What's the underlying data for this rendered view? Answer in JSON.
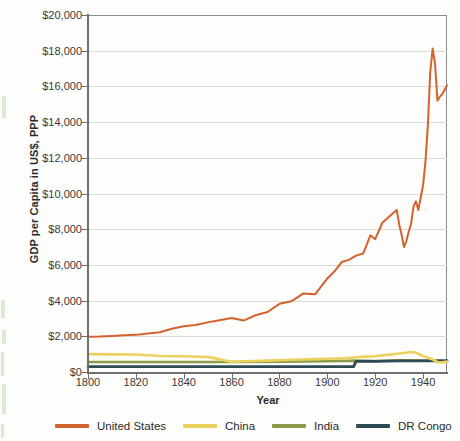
{
  "chart_data": {
    "type": "line",
    "title": "",
    "xlabel": "Year",
    "ylabel": "GDP per Capita in US$, PPP",
    "xlim": [
      1800,
      1950
    ],
    "ylim": [
      0,
      20000
    ],
    "grid": true,
    "legend_position": "bottom",
    "xticks": [
      1800,
      1820,
      1840,
      1860,
      1880,
      1900,
      1920,
      1940
    ],
    "xtick_labels": [
      "1800",
      "1820",
      "1840",
      "1860",
      "1880",
      "1900",
      "1920",
      "1940"
    ],
    "yticks": [
      0,
      2000,
      4000,
      6000,
      8000,
      10000,
      12000,
      14000,
      16000,
      18000,
      20000
    ],
    "ytick_labels": [
      "$0",
      "$2,000",
      "$4,000",
      "$6,000",
      "$8,000",
      "$10,000",
      "$12,000",
      "$14,000",
      "$16,000",
      "$18,000",
      "$20,000"
    ],
    "series": [
      {
        "name": "United States",
        "color": "#D2622E",
        "x": [
          1800,
          1805,
          1810,
          1815,
          1820,
          1825,
          1830,
          1835,
          1840,
          1845,
          1850,
          1855,
          1860,
          1865,
          1870,
          1875,
          1880,
          1885,
          1890,
          1895,
          1900,
          1903,
          1906,
          1909,
          1912,
          1915,
          1918,
          1920,
          1923,
          1926,
          1929,
          1930,
          1931,
          1932,
          1933,
          1934,
          1935,
          1936,
          1937,
          1938,
          1939,
          1940,
          1941,
          1942,
          1943,
          1944,
          1945,
          1946,
          1947,
          1948,
          1950
        ],
        "values": [
          1980,
          1990,
          2020,
          2060,
          2080,
          2160,
          2230,
          2420,
          2560,
          2630,
          2780,
          2900,
          3020,
          2880,
          3180,
          3360,
          3820,
          3960,
          4400,
          4360,
          5240,
          5640,
          6160,
          6280,
          6520,
          6640,
          7660,
          7440,
          8360,
          8720,
          9080,
          8280,
          7720,
          7000,
          7320,
          7860,
          8300,
          9260,
          9560,
          9080,
          9760,
          10460,
          11800,
          13800,
          16800,
          18120,
          17280,
          15200,
          15420,
          15560,
          16060
        ]
      },
      {
        "name": "China",
        "color": "#EBD15E",
        "x": [
          1800,
          1810,
          1820,
          1830,
          1840,
          1850,
          1855,
          1860,
          1865,
          1870,
          1875,
          1880,
          1885,
          1890,
          1895,
          1900,
          1905,
          1910,
          1913,
          1916,
          1920,
          1925,
          1929,
          1932,
          1935,
          1937,
          1940,
          1944,
          1946,
          1948,
          1950
        ],
        "values": [
          1000,
          990,
          980,
          900,
          880,
          840,
          720,
          560,
          600,
          620,
          640,
          660,
          690,
          700,
          720,
          740,
          760,
          790,
          840,
          860,
          880,
          960,
          1020,
          1060,
          1120,
          1080,
          900,
          700,
          560,
          540,
          580
        ]
      },
      {
        "name": "India",
        "color": "#8C9B4A",
        "x": [
          1800,
          1820,
          1840,
          1860,
          1880,
          1900,
          1913,
          1920,
          1930,
          1940,
          1950
        ],
        "values": [
          560,
          560,
          560,
          560,
          580,
          600,
          640,
          620,
          660,
          640,
          600
        ]
      },
      {
        "name": "DR Congo",
        "color": "#2E4B55",
        "x": [
          1800,
          1850,
          1900,
          1911,
          1912,
          1920,
          1930,
          1940,
          1950
        ],
        "values": [
          300,
          300,
          300,
          300,
          600,
          600,
          620,
          620,
          640
        ]
      }
    ]
  },
  "legend": {
    "items": [
      {
        "label": "United States",
        "color": "#D2622E"
      },
      {
        "label": "China",
        "color": "#EBD15E"
      },
      {
        "label": "India",
        "color": "#8C9B4A"
      },
      {
        "label": "DR Congo",
        "color": "#2E4B55"
      }
    ]
  }
}
